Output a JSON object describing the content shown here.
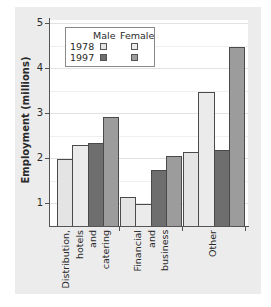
{
  "chart_data": {
    "type": "bar",
    "title": "",
    "xlabel": "",
    "ylabel": "Employment (millions)",
    "ylim": [
      0.5,
      5
    ],
    "yticks": [
      1,
      2,
      3,
      4,
      5
    ],
    "grid": true,
    "legend_position": "top-left inside",
    "categories": [
      "Distribution, hotels and catering",
      "Financial and business",
      "Other"
    ],
    "series": [
      {
        "name": "Male 1978",
        "gender": "Male",
        "year": "1978",
        "color": "#e4e4e4",
        "values": [
          2.0,
          1.15,
          2.15
        ]
      },
      {
        "name": "Female 1978",
        "gender": "Female",
        "year": "1978",
        "color": "#ebebeb",
        "values": [
          2.3,
          0.98,
          3.48
        ]
      },
      {
        "name": "Male 1997",
        "gender": "Male",
        "year": "1997",
        "color": "#6e6e6e",
        "values": [
          2.35,
          1.75,
          2.18
        ]
      },
      {
        "name": "Female 1997",
        "gender": "Female",
        "year": "1997",
        "color": "#9c9c9c",
        "values": [
          2.93,
          2.05,
          4.47
        ]
      }
    ]
  },
  "axis": {
    "y_title": "Employment (millions)",
    "y_ticks": [
      "1",
      "2",
      "3",
      "4",
      "5"
    ]
  },
  "legend": {
    "col_male": "Male",
    "col_female": "Female",
    "row_1978": "1978",
    "row_1997": "1997"
  },
  "x_labels": {
    "cat1": [
      "Distribution,",
      "hotels",
      "and",
      "catering"
    ],
    "cat2": [
      "Financial",
      "and",
      "business"
    ],
    "cat3": [
      "Other"
    ]
  }
}
